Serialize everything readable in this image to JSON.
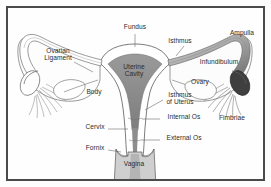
{
  "figure": {
    "type": "labeled-anatomical-illustration",
    "frame_color": "#4a4a4a",
    "background_color": "#fefefe",
    "line_color": "#5a5a5a",
    "cavity_fill": "#8d8d8d",
    "ampulla_fill": "#9a9a9a",
    "ovary_fill": "#3a3a3a",
    "vagina_fill": "#c9c9c9"
  },
  "labels": [
    {
      "id": "fundus",
      "text": "Fundus",
      "x": 135,
      "y": 27,
      "leader": true
    },
    {
      "id": "isthmus",
      "text": "Isthmus",
      "x": 180,
      "y": 41,
      "leader": true
    },
    {
      "id": "ampulla",
      "text": "Ampulla",
      "x": 242,
      "y": 33,
      "leader": false
    },
    {
      "id": "ovarian-ligament",
      "text": "Ovarian\nLigament",
      "x": 58,
      "y": 55,
      "leader": true
    },
    {
      "id": "infundibulum",
      "text": "Infundibulum",
      "x": 219,
      "y": 62,
      "leader": false
    },
    {
      "id": "uterine-cavity",
      "text": "Uterine\nCavity",
      "x": 134,
      "y": 69,
      "leader": false
    },
    {
      "id": "ovary",
      "text": "Ovary",
      "x": 200,
      "y": 82,
      "leader": false
    },
    {
      "id": "body",
      "text": "Body",
      "x": 94,
      "y": 92,
      "leader": false
    },
    {
      "id": "isthmus-of-uterus",
      "text": "Isthmus\nof Uterus",
      "x": 180,
      "y": 95,
      "leader": true
    },
    {
      "id": "internal-os",
      "text": "Internal Os",
      "x": 184,
      "y": 117,
      "leader": true
    },
    {
      "id": "fimbriae",
      "text": "Fimbriae",
      "x": 232,
      "y": 118,
      "leader": false
    },
    {
      "id": "cervix",
      "text": "Cervix",
      "x": 95,
      "y": 127,
      "leader": true
    },
    {
      "id": "external-os",
      "text": "External Os",
      "x": 184,
      "y": 138,
      "leader": true
    },
    {
      "id": "fornix",
      "text": "Fornix",
      "x": 95,
      "y": 148,
      "leader": true
    },
    {
      "id": "vagina",
      "text": "Vagina",
      "x": 134,
      "y": 164,
      "leader": false
    }
  ]
}
